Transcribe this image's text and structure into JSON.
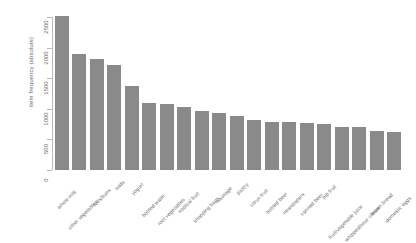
{
  "chart_data": {
    "type": "bar",
    "title": "",
    "xlabel": "",
    "ylabel": "item frequency (absolute)",
    "ylim": [
      0,
      2500
    ],
    "yticks": [
      0,
      500,
      1000,
      1500,
      2000,
      2500
    ],
    "ytick_labels": [
      "0",
      "500",
      "1000",
      "1500",
      "2000",
      "2500"
    ],
    "grid": false,
    "legend": "none",
    "bar_color": "#8a8a8a",
    "axis_color": "#b9b9b9",
    "text_color": "#6b6b6b",
    "categories": [
      "whole milk",
      "other vegetables",
      "rolls/buns",
      "soda",
      "yogurt",
      "bottled water",
      "root vegetables",
      "tropical fruit",
      "shopping bags",
      "sausage",
      "pastry",
      "citrus fruit",
      "bottled beer",
      "newspapers",
      "canned beer",
      "pip fruit",
      "fruit/vegetable juice",
      "whipped/sour cream",
      "brown bread",
      "domestic eggs"
    ],
    "values": [
      2513,
      1903,
      1809,
      1715,
      1372,
      1087,
      1072,
      1032,
      969,
      924,
      875,
      814,
      792,
      785,
      764,
      744,
      711,
      705,
      638,
      624
    ]
  },
  "axis": {
    "y_title": "item frequency (absolute)"
  }
}
